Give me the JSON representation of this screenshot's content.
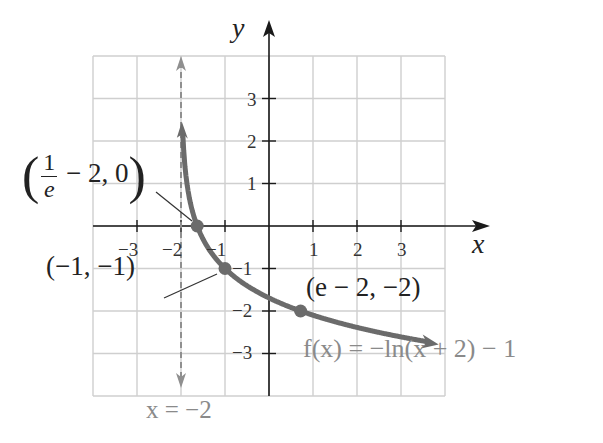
{
  "chart_data": {
    "type": "line",
    "title": "",
    "function_label": "f(x) = −ln(x + 2) − 1",
    "xlabel": "x",
    "ylabel": "y",
    "xlim": [
      -4,
      4
    ],
    "ylim": [
      -4,
      4
    ],
    "grid": true,
    "x_ticks": [
      -3,
      -2,
      -1,
      1,
      2,
      3
    ],
    "y_ticks": [
      3,
      2,
      1,
      -1,
      -2,
      -3
    ],
    "x_tick_labels": [
      "−3",
      "−2",
      "−1",
      "1",
      "2",
      "3"
    ],
    "y_tick_labels": [
      "3",
      "2",
      "1",
      "−1",
      "−2",
      "−3"
    ],
    "asymptote": {
      "type": "vertical",
      "x": -2,
      "label": "x = −2",
      "style": "dashed"
    },
    "series": [
      {
        "name": "f(x) = −ln(x + 2) − 1",
        "x": [
          -1.95,
          -1.9,
          -1.8,
          -1.632,
          -1.5,
          -1.0,
          0.0,
          0.718,
          1.0,
          2.0,
          3.0,
          3.7
        ],
        "y": [
          1.996,
          1.303,
          0.609,
          0.0,
          -0.307,
          -1.0,
          -1.693,
          -2.0,
          -2.099,
          -2.386,
          -2.609,
          -2.741
        ]
      }
    ],
    "annotations": [
      {
        "label": "(1/e − 2, 0)",
        "x": -1.632,
        "y": 0
      },
      {
        "label": "(−1, −1)",
        "x": -1,
        "y": -1
      },
      {
        "label": "(e − 2, −2)",
        "x": 0.718,
        "y": -2
      }
    ]
  },
  "labels": {
    "x_axis": "x",
    "y_axis": "y",
    "asymptote": "x = −2",
    "function": "f(x) = −ln(x + 2) − 1",
    "pt1_frac_num": "1",
    "pt1_frac_den": "e",
    "pt1_rest": " − 2, 0",
    "pt2": "(−1, −1)",
    "pt3": "(e − 2, −2)",
    "ticks": {
      "xm3": "−3",
      "xm2": "−2",
      "xm1": "−1",
      "x1": "1",
      "x2": "2",
      "x3": "3",
      "y3": "3",
      "y2": "2",
      "y1": "1",
      "ym1": "−1",
      "ym2": "−2",
      "ym3": "−3"
    }
  },
  "colors": {
    "curve": "#6b6b6b",
    "asymptote": "#8f8f8f",
    "grid": "#cfcfcf",
    "axes": "#1a1a1a"
  }
}
